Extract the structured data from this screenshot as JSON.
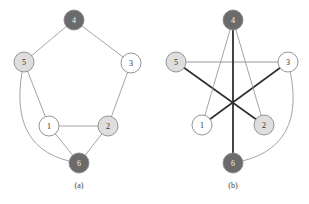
{
  "figure": {
    "width": 309,
    "height": 204,
    "background": "#ffffff"
  },
  "palette": {
    "node_dark": "#6b6b6b",
    "node_light": "#dedede",
    "node_white": "#ffffff",
    "node_stroke": "#8a8a8a",
    "edge_light": "#9a9a9a",
    "edge_dark": "#2f2f2f",
    "label_dark_text": "#f2f2f2",
    "label_light_text": "#2b2b2b",
    "caption_color": "#3a3a3a"
  },
  "panels": [
    {
      "id": "panel-a",
      "caption": "(a)",
      "caption_x": 79,
      "caption_y": 188,
      "nodes": [
        {
          "id": "4",
          "label": "4",
          "cx": 74,
          "cy": 20,
          "r": 10,
          "fill": "#6b6b6b",
          "text": "light"
        },
        {
          "id": "5",
          "label": "5",
          "cx": 24,
          "cy": 62,
          "r": 10,
          "fill": "#dedede",
          "text": "dark"
        },
        {
          "id": "3",
          "label": "3",
          "cx": 131,
          "cy": 63,
          "r": 10,
          "fill": "#ffffff",
          "text": "dark"
        },
        {
          "id": "1",
          "label": "1",
          "cx": 49,
          "cy": 126,
          "r": 10,
          "fill": "#ffffff",
          "text": "dark"
        },
        {
          "id": "2",
          "label": "2",
          "cx": 108,
          "cy": 126,
          "r": 10,
          "fill": "#dedede",
          "text": "dark"
        },
        {
          "id": "6",
          "label": "6",
          "cx": 79,
          "cy": 163,
          "r": 10,
          "fill": "#6b6b6b",
          "text": "light"
        }
      ],
      "edges": [
        {
          "from": "4",
          "to": "5",
          "type": "line",
          "color": "#9a9a9a",
          "width": 0.9
        },
        {
          "from": "4",
          "to": "3",
          "type": "line",
          "color": "#9a9a9a",
          "width": 0.9
        },
        {
          "from": "5",
          "to": "1",
          "type": "line",
          "color": "#9a9a9a",
          "width": 0.9
        },
        {
          "from": "3",
          "to": "2",
          "type": "line",
          "color": "#9a9a9a",
          "width": 0.9
        },
        {
          "from": "1",
          "to": "2",
          "type": "line",
          "color": "#9a9a9a",
          "width": 0.9
        },
        {
          "from": "1",
          "to": "6",
          "type": "line",
          "color": "#9a9a9a",
          "width": 0.9
        },
        {
          "from": "2",
          "to": "6",
          "type": "line",
          "color": "#9a9a9a",
          "width": 0.9
        },
        {
          "from": "5",
          "to": "6",
          "type": "curve",
          "color": "#9a9a9a",
          "width": 0.9,
          "ctrl_x": 4,
          "ctrl_y": 152
        }
      ]
    },
    {
      "id": "panel-b",
      "caption": "(b)",
      "caption_x": 233,
      "caption_y": 188,
      "nodes": [
        {
          "id": "4",
          "label": "4",
          "cx": 233,
          "cy": 20,
          "r": 10,
          "fill": "#6b6b6b",
          "text": "light"
        },
        {
          "id": "5",
          "label": "5",
          "cx": 176,
          "cy": 62,
          "r": 10,
          "fill": "#dedede",
          "text": "dark"
        },
        {
          "id": "3",
          "label": "3",
          "cx": 288,
          "cy": 62,
          "r": 10,
          "fill": "#ffffff",
          "text": "dark"
        },
        {
          "id": "1",
          "label": "1",
          "cx": 202,
          "cy": 125,
          "r": 10,
          "fill": "#ffffff",
          "text": "dark"
        },
        {
          "id": "2",
          "label": "2",
          "cx": 264,
          "cy": 125,
          "r": 10,
          "fill": "#dedede",
          "text": "dark"
        },
        {
          "id": "6",
          "label": "6",
          "cx": 233,
          "cy": 163,
          "r": 10,
          "fill": "#6b6b6b",
          "text": "light"
        }
      ],
      "edges": [
        {
          "from": "5",
          "to": "3",
          "type": "line",
          "color": "#9a9a9a",
          "width": 1.0
        },
        {
          "from": "5",
          "to": "2",
          "type": "line",
          "color": "#2f2f2f",
          "width": 1.6
        },
        {
          "from": "3",
          "to": "1",
          "type": "line",
          "color": "#2f2f2f",
          "width": 1.6
        },
        {
          "from": "4",
          "to": "1",
          "type": "line",
          "color": "#9a9a9a",
          "width": 0.9
        },
        {
          "from": "4",
          "to": "2",
          "type": "line",
          "color": "#9a9a9a",
          "width": 0.9
        },
        {
          "from": "4",
          "to": "6",
          "type": "line",
          "color": "#2f2f2f",
          "width": 1.8
        },
        {
          "from": "3",
          "to": "6",
          "type": "curve",
          "color": "#9a9a9a",
          "width": 0.9,
          "ctrl_x": 311,
          "ctrl_y": 150
        }
      ]
    }
  ]
}
